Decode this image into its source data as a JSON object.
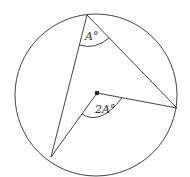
{
  "diagram": {
    "title_fragment": "",
    "colors": {
      "stroke": "#444444",
      "dot": "#222222",
      "label": "#333333",
      "background": "#ffffff"
    },
    "circle": {
      "cx": 96,
      "cy": 95,
      "r": 81
    },
    "center_point": {
      "x": 97,
      "y": 93
    },
    "points": {
      "top": {
        "x": 87,
        "y": 15
      },
      "right": {
        "x": 177,
        "y": 108
      },
      "bottom_left": {
        "x": 51,
        "y": 157
      }
    },
    "labels": {
      "inscribed_angle": "A°",
      "central_angle": "2A°"
    }
  }
}
